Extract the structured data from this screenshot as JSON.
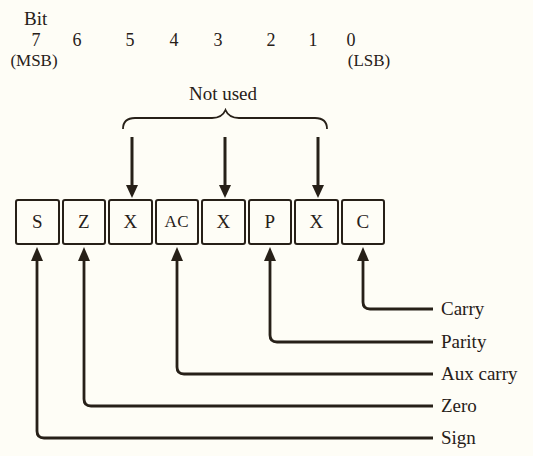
{
  "page": {
    "paper_color": "#fefdf6",
    "ink_color": "#272018"
  },
  "bit_scale": {
    "title": "Bit",
    "numbers": [
      "7",
      "6",
      "5",
      "4",
      "3",
      "2",
      "1",
      "0"
    ],
    "msb_label": "(MSB)",
    "lsb_label": "(LSB)"
  },
  "annotation": {
    "not_used_label": "Not used"
  },
  "register": {
    "cells": [
      {
        "bit": "7",
        "label": "S"
      },
      {
        "bit": "6",
        "label": "Z"
      },
      {
        "bit": "5",
        "label": "X"
      },
      {
        "bit": "4",
        "label": "AC"
      },
      {
        "bit": "3",
        "label": "X"
      },
      {
        "bit": "2",
        "label": "P"
      },
      {
        "bit": "1",
        "label": "X"
      },
      {
        "bit": "0",
        "label": "C"
      }
    ]
  },
  "flags": [
    {
      "label": "Carry"
    },
    {
      "label": "Parity"
    },
    {
      "label": "Aux carry"
    },
    {
      "label": "Zero"
    },
    {
      "label": "Sign"
    }
  ]
}
